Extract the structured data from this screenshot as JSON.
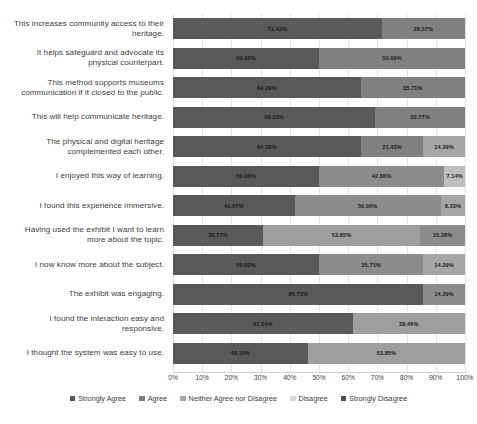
{
  "chart_data": {
    "type": "bar",
    "subtype": "stacked-bar-horizontal-100pct",
    "title": "",
    "xlabel": "",
    "ylabel": "",
    "xlim": [
      0,
      100
    ],
    "xticks": [
      "0%",
      "10%",
      "20%",
      "30%",
      "40%",
      "50%",
      "60%",
      "70%",
      "80%",
      "90%",
      "100%"
    ],
    "grid": true,
    "legend_position": "bottom",
    "orientation": "horizontal",
    "value_suffix": "%",
    "series": [
      {
        "name": "Strongly Agree",
        "color": "#595959",
        "values": [
          71.43,
          50.0,
          64.29,
          69.23,
          64.29,
          50.0,
          41.67,
          30.77,
          50.0,
          85.71,
          61.54,
          46.15
        ]
      },
      {
        "name": "Agree",
        "color": "#808080",
        "values": [
          28.57,
          50.0,
          35.71,
          30.77,
          21.43,
          42.86,
          50.0,
          53.85,
          35.71,
          14.29,
          38.46,
          53.85
        ]
      },
      {
        "name": "Neither Agree nor Disagree",
        "color": "#a6a6a6",
        "values": [
          0,
          0,
          0,
          0,
          14.29,
          7.14,
          8.33,
          15.38,
          14.29,
          0,
          0,
          0
        ]
      },
      {
        "name": "Disagree",
        "color": "#d9d9d9",
        "values": [
          0,
          0,
          0,
          0,
          0,
          0,
          0,
          0,
          0,
          0,
          0,
          0
        ]
      },
      {
        "name": "Strongly Disagree",
        "color": "#4d4d4d",
        "values": [
          0,
          0,
          0,
          0,
          0,
          0,
          0,
          0,
          0,
          0,
          0,
          0
        ]
      }
    ],
    "categories": [
      "This increases community access to their heritage.",
      "It helps safeguard and advocate its physical counterpart.",
      "This method supports museums communication if it closed to the public.",
      "This will help communicate heritage.",
      "The physical and digital heritage complemented each other.",
      "I enjoyed this way of learning.",
      "I found this experience immersive.",
      "Having used the exhibit I want to learn more about the topic.",
      "I now know more about the subject.",
      "The exhibit was engaging.",
      "I found the interaction easy and responsive.",
      "I thought the system was easy to use."
    ],
    "rows": [
      {
        "category": "This increases community access to their heritage.",
        "segments": [
          {
            "series": "Strongly Agree",
            "value": 71.43,
            "label": "71.43%",
            "color": "#595959"
          },
          {
            "series": "Agree",
            "value": 28.57,
            "label": "28.57%",
            "color": "#808080"
          }
        ]
      },
      {
        "category": "It helps safeguard and advocate its physical counterpart.",
        "segments": [
          {
            "series": "Strongly Agree",
            "value": 50.0,
            "label": "50.00%",
            "color": "#595959"
          },
          {
            "series": "Agree",
            "value": 50.0,
            "label": "50.00%",
            "color": "#808080"
          }
        ]
      },
      {
        "category": "This method supports museums communication if it closed to the public.",
        "segments": [
          {
            "series": "Strongly Agree",
            "value": 64.29,
            "label": "64.29%",
            "color": "#595959"
          },
          {
            "series": "Agree",
            "value": 35.71,
            "label": "35.71%",
            "color": "#808080"
          }
        ]
      },
      {
        "category": "This will help communicate heritage.",
        "segments": [
          {
            "series": "Strongly Agree",
            "value": 69.23,
            "label": "69.23%",
            "color": "#595959"
          },
          {
            "series": "Agree",
            "value": 30.77,
            "label": "30.77%",
            "color": "#808080"
          }
        ]
      },
      {
        "category": "The physical and digital heritage complemented each other.",
        "segments": [
          {
            "series": "Strongly Agree",
            "value": 64.29,
            "label": "64.29%",
            "color": "#595959"
          },
          {
            "series": "Agree",
            "value": 21.43,
            "label": "21.43%",
            "color": "#808080"
          },
          {
            "series": "Neither Agree nor Disagree",
            "value": 14.29,
            "label": "14.29%",
            "color": "#a6a6a6"
          }
        ]
      },
      {
        "category": "I enjoyed this way of learning.",
        "segments": [
          {
            "series": "Strongly Agree",
            "value": 50.0,
            "label": "50.00%",
            "color": "#595959"
          },
          {
            "series": "Agree",
            "value": 42.86,
            "label": "42.86%",
            "color": "#8c8c8c"
          },
          {
            "series": "Neither Agree nor Disagree",
            "value": 7.14,
            "label": "7.14%",
            "color": "#bfbfbf"
          }
        ]
      },
      {
        "category": "I found this experience immersive.",
        "segments": [
          {
            "series": "Strongly Agree",
            "value": 41.67,
            "label": "41.67%",
            "color": "#595959"
          },
          {
            "series": "Agree",
            "value": 50.0,
            "label": "50.00%",
            "color": "#8c8c8c"
          },
          {
            "series": "Neither Agree nor Disagree",
            "value": 8.33,
            "label": "8.33%",
            "color": "#a6a6a6"
          }
        ]
      },
      {
        "category": "Having used the exhibit I want to learn more about the topic.",
        "segments": [
          {
            "series": "Strongly Agree",
            "value": 30.77,
            "label": "30.77%",
            "color": "#595959"
          },
          {
            "series": "Agree",
            "value": 53.85,
            "label": "53.85%",
            "color": "#9e9e9e"
          },
          {
            "series": "Neither Agree nor Disagree",
            "value": 15.38,
            "label": "15.38%",
            "color": "#8c8c8c"
          }
        ]
      },
      {
        "category": "I now know more about the subject.",
        "segments": [
          {
            "series": "Strongly Agree",
            "value": 50.0,
            "label": "50.00%",
            "color": "#595959"
          },
          {
            "series": "Agree",
            "value": 35.71,
            "label": "35.71%",
            "color": "#8c8c8c"
          },
          {
            "series": "Neither Agree nor Disagree",
            "value": 14.29,
            "label": "14.29%",
            "color": "#a6a6a6"
          }
        ]
      },
      {
        "category": "The exhibit was engaging.",
        "segments": [
          {
            "series": "Strongly Agree",
            "value": 85.71,
            "label": "85.71%",
            "color": "#595959"
          },
          {
            "series": "Agree",
            "value": 14.29,
            "label": "14.29%",
            "color": "#8c8c8c"
          }
        ]
      },
      {
        "category": "I found the interaction easy and responsive.",
        "segments": [
          {
            "series": "Strongly Agree",
            "value": 61.54,
            "label": "61.54%",
            "color": "#595959"
          },
          {
            "series": "Agree",
            "value": 38.46,
            "label": "38.46%",
            "color": "#9e9e9e"
          }
        ]
      },
      {
        "category": "I thought the system was easy to use.",
        "segments": [
          {
            "series": "Strongly Agree",
            "value": 46.15,
            "label": "46.15%",
            "color": "#595959"
          },
          {
            "series": "Agree",
            "value": 53.85,
            "label": "53.85%",
            "color": "#9e9e9e"
          }
        ]
      }
    ],
    "legend": [
      {
        "label": "Strongly Agree",
        "color": "#595959"
      },
      {
        "label": "Agree",
        "color": "#808080"
      },
      {
        "label": "Neither Agree nor Disagree",
        "color": "#a6a6a6"
      },
      {
        "label": "Disagree",
        "color": "#d9d9d9"
      },
      {
        "label": "Strongly Disagree",
        "color": "#4d4d4d"
      }
    ]
  }
}
